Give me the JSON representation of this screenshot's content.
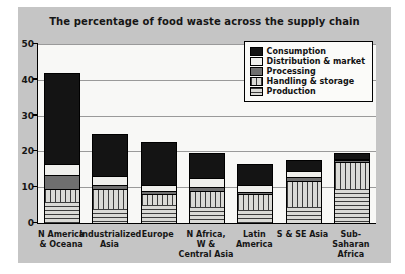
{
  "panel": {
    "background": "#c5c5c5"
  },
  "chart_data": {
    "type": "bar",
    "stacked": true,
    "title": "The percentage of food waste across the supply chain",
    "categories": [
      {
        "label": "N America & Oceana",
        "lines": [
          "N America",
          "& Oceana"
        ]
      },
      {
        "label": "Industrialized Asia",
        "lines": [
          "Industrialized",
          "Asia"
        ]
      },
      {
        "label": "Europe",
        "lines": [
          "Europe"
        ]
      },
      {
        "label": "N Africa, W & Central Asia",
        "lines": [
          "N Africa,",
          "W &",
          "Central Asia"
        ]
      },
      {
        "label": "Latin America",
        "lines": [
          "Latin",
          "America"
        ]
      },
      {
        "label": "S & SE Asia",
        "lines": [
          "S & SE Asia"
        ]
      },
      {
        "label": "Sub-Saharan Africa",
        "lines": [
          "Sub-",
          "Saharan",
          "Africa"
        ]
      }
    ],
    "series": [
      {
        "name": "Production",
        "pattern": "hlines",
        "values": [
          6,
          4,
          5,
          4.5,
          3.5,
          4.5,
          9.5
        ]
      },
      {
        "name": "Handling & storage",
        "pattern": "vlines",
        "values": [
          3.5,
          5.5,
          3,
          4.5,
          4.5,
          7.3,
          7.5
        ]
      },
      {
        "name": "Processing",
        "pattern": "dark",
        "values": [
          4,
          1,
          1,
          1,
          0.7,
          1,
          0.5
        ]
      },
      {
        "name": "Distribution & market",
        "pattern": "light",
        "values": [
          3,
          2.5,
          1.5,
          2.5,
          1.8,
          1.7,
          0.5
        ]
      },
      {
        "name": "Consumption",
        "pattern": "black",
        "values": [
          25.5,
          12,
          12,
          7,
          6,
          3,
          1.5
        ]
      }
    ],
    "totals": [
      42,
      25,
      22.5,
      19.5,
      16.5,
      17.5,
      19.5
    ],
    "ylim": [
      0,
      50
    ],
    "yticks": [
      0,
      10,
      20,
      30,
      40,
      50
    ],
    "grid": true,
    "legend_position": "top-right",
    "legend_order": [
      "Consumption",
      "Distribution & market",
      "Processing",
      "Handling & storage",
      "Production"
    ]
  },
  "colors": {
    "consumption": "#141414",
    "distribution_market": "#efefec",
    "processing": "#6f6f6f",
    "pattern_line": "#3c3c3c",
    "pattern_bg": "#dadad6",
    "plot_bg": "#f8f8f6",
    "gridline": "#9a9a9a",
    "panel_bg": "#c5c5c5"
  }
}
